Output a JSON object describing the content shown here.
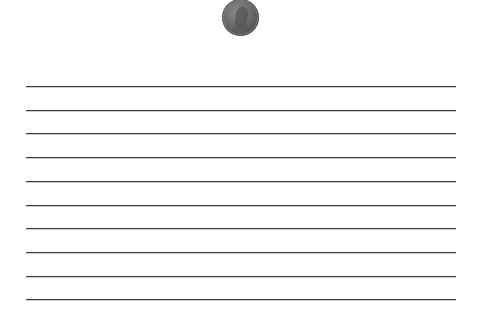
{
  "coin": {
    "icon": "penny-coin-icon",
    "description": "Lincoln profile penny",
    "color": "#6a6a6a"
  },
  "ruled_lines": {
    "count": 10,
    "color": "#3c3c3c",
    "y_positions": [
      86,
      110,
      133,
      157,
      181,
      205,
      228,
      252,
      276,
      299
    ]
  }
}
